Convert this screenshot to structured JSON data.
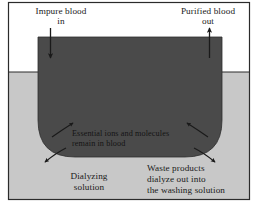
{
  "figure": {
    "labels": {
      "impure_blood_in": "Impure blood\nin",
      "purified_blood_out": "Purified blood\nout",
      "essential_ions": "Essential ions and molecules\nremain in blood",
      "dialyzing_solution": "Dialyzing\nsolution",
      "waste_products": "Waste products\ndialyze out into\nthe washing solution"
    },
    "colors": {
      "background": "#ffffff",
      "solution_fill": "#c8c8c8",
      "tube_fill": "#4a4a4a",
      "frame_border": "#2b2b2b",
      "text": "#1a1a1a",
      "arrow": "#1a1a1a"
    },
    "geometry": {
      "frame": {
        "x": 8,
        "y": 2,
        "width": 242,
        "height": 198
      },
      "solution_surface_y": 72,
      "left_tube": {
        "x": 38,
        "width": 25,
        "top": 37
      },
      "right_tube": {
        "x": 197,
        "width": 25,
        "top": 37
      },
      "tube_bottom_y": 157
    },
    "arrows": {
      "inflow": "down-arrow-icon",
      "outflow": "up-arrow-icon",
      "ions_retained": "inward-arrow-icon",
      "waste_exiting": "outward-arrow-icon"
    }
  }
}
